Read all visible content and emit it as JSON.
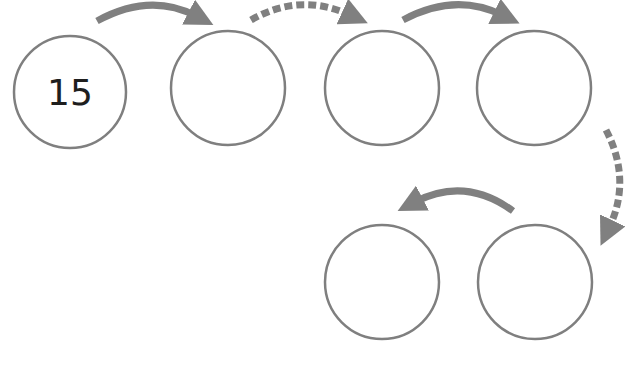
{
  "diagram": {
    "type": "number-chain",
    "colors": {
      "circle_stroke": "#7f7f7f",
      "arrow_fill": "#808080",
      "text": "#1e1e1e",
      "background": "#ffffff"
    },
    "nodes": [
      {
        "id": "n1",
        "value": "15",
        "cx": 70,
        "cy": 92,
        "r": 56
      },
      {
        "id": "n2",
        "value": "",
        "cx": 228,
        "cy": 88,
        "r": 57
      },
      {
        "id": "n3",
        "value": "",
        "cx": 382,
        "cy": 88,
        "r": 57
      },
      {
        "id": "n4",
        "value": "",
        "cx": 534,
        "cy": 88,
        "r": 57
      },
      {
        "id": "n5",
        "value": "",
        "cx": 382,
        "cy": 282,
        "r": 57
      },
      {
        "id": "n6",
        "value": "",
        "cx": 535,
        "cy": 282,
        "r": 57
      }
    ],
    "edges": [
      {
        "from": "n1",
        "to": "n2",
        "style": "solid"
      },
      {
        "from": "n2",
        "to": "n3",
        "style": "dashed"
      },
      {
        "from": "n3",
        "to": "n4",
        "style": "solid"
      },
      {
        "from": "n4",
        "to": "n6",
        "style": "dashed"
      },
      {
        "from": "n6",
        "to": "n5",
        "style": "solid"
      }
    ]
  }
}
